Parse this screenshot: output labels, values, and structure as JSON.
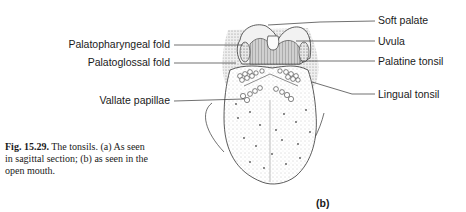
{
  "figure": {
    "panel": "(b)",
    "labels_right": [
      {
        "id": "soft-palate",
        "text": "Soft palate"
      },
      {
        "id": "uvula",
        "text": "Uvula"
      },
      {
        "id": "palatine-tonsil",
        "text": "Palatine tonsil"
      },
      {
        "id": "lingual-tonsil",
        "text": "Lingual tonsil"
      }
    ],
    "labels_left": [
      {
        "id": "palatopharyngeal-fold",
        "text": "Palatopharyngeal fold"
      },
      {
        "id": "palatoglossal-fold",
        "text": "Palatoglossal fold"
      },
      {
        "id": "vallate-papillae",
        "text": "Vallate papillae"
      }
    ]
  },
  "caption": {
    "fig_number": "Fig. 15.29.",
    "text": " The tonsils. (a) As seen in sagittal section; (b) as seen in the open mouth."
  }
}
